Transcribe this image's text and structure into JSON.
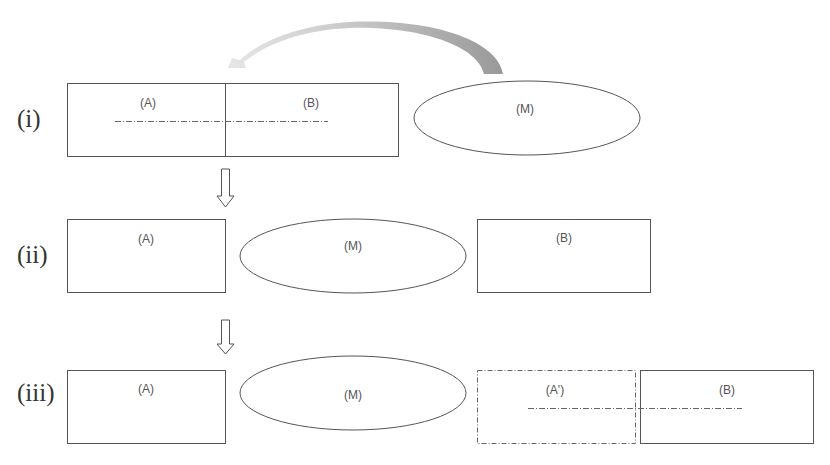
{
  "diagram": {
    "rows": [
      {
        "id": "i",
        "label": "(i)",
        "boxes": {
          "a": "(A)",
          "b": "(B)",
          "m": "(M)"
        }
      },
      {
        "id": "ii",
        "label": "(ii)",
        "boxes": {
          "a": "(A)",
          "m": "(M)",
          "b": "(B)"
        }
      },
      {
        "id": "iii",
        "label": "(iii)",
        "boxes": {
          "a": "(A)",
          "m": "(M)",
          "a_prime": "(A')",
          "b": "(B)"
        }
      }
    ],
    "colors": {
      "stroke": "#555555",
      "arrow_fill": "#b0b0b0",
      "text": "#555555"
    }
  }
}
